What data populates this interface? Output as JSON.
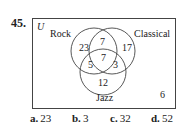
{
  "problem_number": "45.",
  "diagram": {
    "universe_label": "U",
    "sets": [
      "Rock",
      "Classical",
      "Jazz"
    ],
    "regions": {
      "rock_only": "23",
      "rock_classical_only": "7",
      "classical_only": "17",
      "all_three": "7",
      "rock_jazz_only": "5",
      "classical_jazz_only": "3",
      "jazz_only": "12",
      "outside": "6"
    }
  },
  "answers": [
    {
      "letter": "a.",
      "value": "23"
    },
    {
      "letter": "b.",
      "value": "3"
    },
    {
      "letter": "c.",
      "value": "32"
    },
    {
      "letter": "d.",
      "value": "52"
    }
  ]
}
